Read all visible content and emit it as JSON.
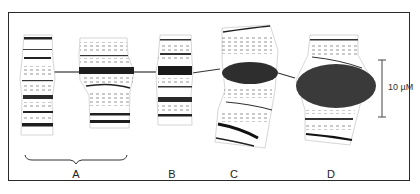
{
  "figure": {
    "panels": [
      {
        "id": "A",
        "label": "A",
        "description": "two chromosome segments grouped by bracket"
      },
      {
        "id": "B",
        "label": "B",
        "description": "chromosome segment with dark band"
      },
      {
        "id": "C",
        "label": "C",
        "description": "chromosome segment with dark elliptical puff"
      },
      {
        "id": "D",
        "label": "D",
        "description": "chromosome segment with large dark puff"
      }
    ],
    "scale_bar": {
      "label": "10 µM",
      "length_px": 56
    },
    "colors": {
      "frame": "#2a2a2a",
      "band_dark": "#1e1e1e",
      "puff": "#3a3a3a",
      "line": "#555555"
    }
  }
}
